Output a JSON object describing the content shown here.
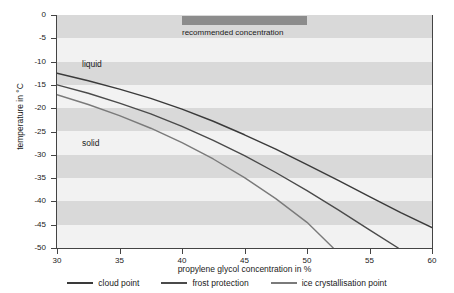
{
  "chart_data": {
    "type": "line",
    "title": "",
    "xlabel": "propylene glycol concentration in %",
    "ylabel": "temperature in °C",
    "xlim": [
      30,
      60
    ],
    "ylim": [
      -50,
      0
    ],
    "xticks": [
      30,
      35,
      40,
      45,
      50,
      55,
      60
    ],
    "xtick_labels": [
      "30",
      "35",
      "40",
      "45",
      "50",
      "55",
      "60"
    ],
    "yticks": [
      0,
      -5,
      -10,
      -15,
      -20,
      -25,
      -30,
      -35,
      -40,
      -45,
      -50
    ],
    "ytick_labels": [
      "0",
      "-5",
      "-10",
      "-15",
      "-20",
      "-25",
      "-30",
      "-35",
      "-40",
      "-45",
      "-50"
    ],
    "grid": "horizontal-bands",
    "legend_position": "bottom",
    "series": [
      {
        "name": "cloud point",
        "color": "#3a3a3a",
        "x": [
          30,
          32.5,
          35,
          37.5,
          40,
          42.5,
          45,
          47.5,
          50,
          52.5,
          55,
          57.5,
          60
        ],
        "y": [
          -12.5,
          -14.1,
          -15.9,
          -17.9,
          -20.2,
          -22.8,
          -25.7,
          -28.8,
          -32.1,
          -35.5,
          -39.0,
          -42.4,
          -45.6
        ]
      },
      {
        "name": "frost protection",
        "color": "#4a4a4a",
        "x": [
          30,
          32.5,
          35,
          37.5,
          40,
          42.5,
          45,
          47.5,
          50,
          52.5,
          55,
          57.3
        ],
        "y": [
          -15.0,
          -16.8,
          -18.9,
          -21.2,
          -23.9,
          -26.9,
          -30.2,
          -33.8,
          -37.7,
          -41.8,
          -46.1,
          -50.0
        ]
      },
      {
        "name": "ice crystallisation point",
        "color": "#7a7a7a",
        "x": [
          30,
          32.5,
          35,
          37.5,
          40,
          42.5,
          45,
          47.5,
          50,
          52.1
        ],
        "y": [
          -17.1,
          -19.2,
          -21.6,
          -24.3,
          -27.4,
          -30.9,
          -34.9,
          -39.4,
          -44.5,
          -50.0
        ]
      }
    ],
    "annotations": [
      {
        "name": "recommended-concentration-band",
        "label": "recommended concentration",
        "x_start": 40,
        "x_end": 50,
        "color": "#8c8c8c"
      },
      {
        "name": "liquid-region",
        "label": "liquid"
      },
      {
        "name": "solid-region",
        "label": "solid"
      }
    ],
    "bands": {
      "color_dark": "#d9d9d9",
      "color_light": "#f2f2f2",
      "interval_deg": 5
    }
  },
  "legend": {
    "items": [
      {
        "label": "cloud point",
        "color": "#3a3a3a"
      },
      {
        "label": "frost protection",
        "color": "#4a4a4a"
      },
      {
        "label": "ice crystallisation point",
        "color": "#7a7a7a"
      }
    ]
  }
}
